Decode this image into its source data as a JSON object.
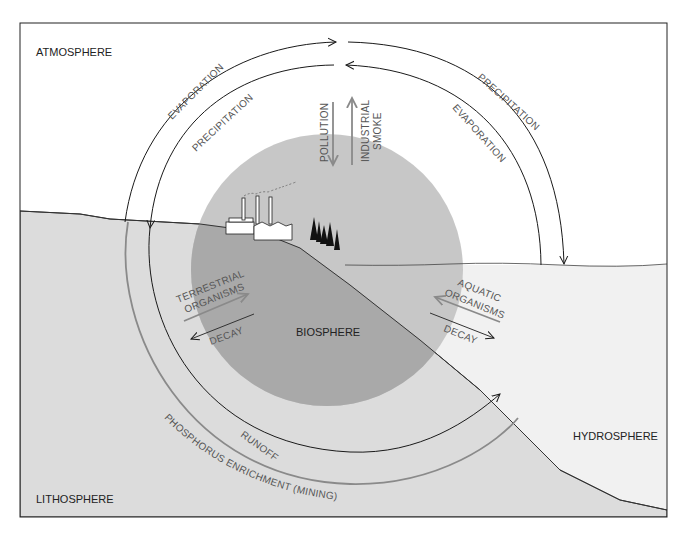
{
  "diagram": {
    "regions": {
      "atmosphere": "ATMOSPHERE",
      "biosphere": "BIOSPHERE",
      "hydrosphere": "HYDROSPHERE",
      "lithosphere": "LITHOSPHERE"
    },
    "flows": {
      "evaporation_left": "EVAPORATION",
      "precipitation_left": "PRECIPITATION",
      "precipitation_right": "PRECIPITATION",
      "evaporation_right": "EVAPORATION",
      "pollution": "POLLUTION",
      "industrial_smoke_line1": "INDUSTRIAL",
      "industrial_smoke_line2": "SMOKE",
      "terrestrial_line1": "TERRESTRIAL",
      "terrestrial_line2": "ORGANISMS",
      "decay_left": "DECAY",
      "aquatic_line1": "AQUATIC",
      "aquatic_line2": "ORGANISMS",
      "decay_right": "DECAY",
      "runoff": "RUNOFF",
      "phosphorus": "PHOSPHORUS ENRICHMENT (MINING)"
    },
    "colors": {
      "land": "#dcdcdc",
      "biosphere": "#c4c4c4",
      "biosphere_on_land": "#a9a9a9",
      "water": "#f1f1f1",
      "gray_arrow": "#8a8a8a",
      "line": "#1a1a1a"
    }
  }
}
